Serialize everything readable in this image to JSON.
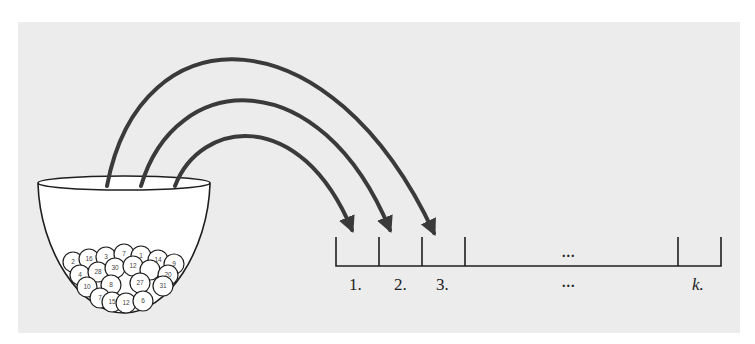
{
  "diagram": {
    "urn": {
      "balls": [
        "2",
        "16",
        "3",
        "7",
        "1",
        "14",
        "9",
        "4",
        "28",
        "30",
        "12",
        "20",
        "10",
        "8",
        "27",
        "31",
        "7",
        "15",
        "12",
        "6"
      ]
    },
    "slots": {
      "labels": [
        "1.",
        "2.",
        "3.",
        "...",
        "k."
      ],
      "inside_ellipsis": "..."
    },
    "arrows": {
      "count": 3,
      "color": "#3a3a3a"
    },
    "colors": {
      "panel": "#ececec",
      "ink": "#1e1e1e",
      "arrow": "#3a3a3a",
      "bowl_fill": "#ffffff"
    }
  }
}
